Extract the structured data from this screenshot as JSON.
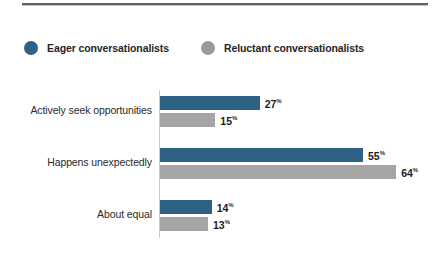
{
  "chart_data": {
    "type": "bar",
    "orientation": "horizontal",
    "title": "",
    "subtitle": "",
    "xlabel": "",
    "ylabel": "",
    "xlim": [
      0,
      70
    ],
    "grid": false,
    "legend_position": "top-left",
    "value_suffix": "%",
    "categories": [
      "Actively seek opportunities",
      "Happens unexpectedly",
      "About equal"
    ],
    "series": [
      {
        "name": "Eager conversationalists",
        "color": "#2e6183",
        "values": [
          27,
          55,
          14
        ],
        "labels": [
          "27",
          "55",
          "14"
        ]
      },
      {
        "name": "Reluctant conversationalists",
        "color": "#a5a5a5",
        "values": [
          15,
          64,
          13
        ],
        "labels": [
          "15",
          "64",
          "13"
        ]
      }
    ]
  },
  "legend": {
    "items": [
      {
        "label": "Eager conversationalists",
        "marker": "circle-marker-blue",
        "color": "#2e6183"
      },
      {
        "label": "Reluctant conversationalists",
        "marker": "circle-marker-gray",
        "color": "#9a9a9a"
      }
    ]
  },
  "colors": {
    "series_blue": "#2e6183",
    "series_gray": "#a5a5a5",
    "rule": "#5d656b",
    "axis": "#c9cdd0",
    "text": "#262626",
    "background": "#ffffff"
  },
  "percent_symbol": "%"
}
